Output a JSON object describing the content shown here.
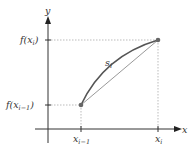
{
  "diagram": {
    "axis_x_label": "x",
    "axis_y_label": "y",
    "point_upper": {
      "x_label": "x_i",
      "y_label": "f(x_i)"
    },
    "point_lower": {
      "x_label": "x_{i-1}",
      "y_label": "f(x_{i-1})"
    },
    "segment_label": "s_i",
    "colors": {
      "axis": "#333333",
      "curve": "#555555",
      "chord": "#999999",
      "guides": "#aaaaaa",
      "point": "#666666"
    }
  },
  "text": {
    "y": "y",
    "x": "x",
    "f_open": "f(x",
    "close": ")",
    "i": "i",
    "im1": "i−1",
    "xx": "x",
    "s": "s"
  }
}
